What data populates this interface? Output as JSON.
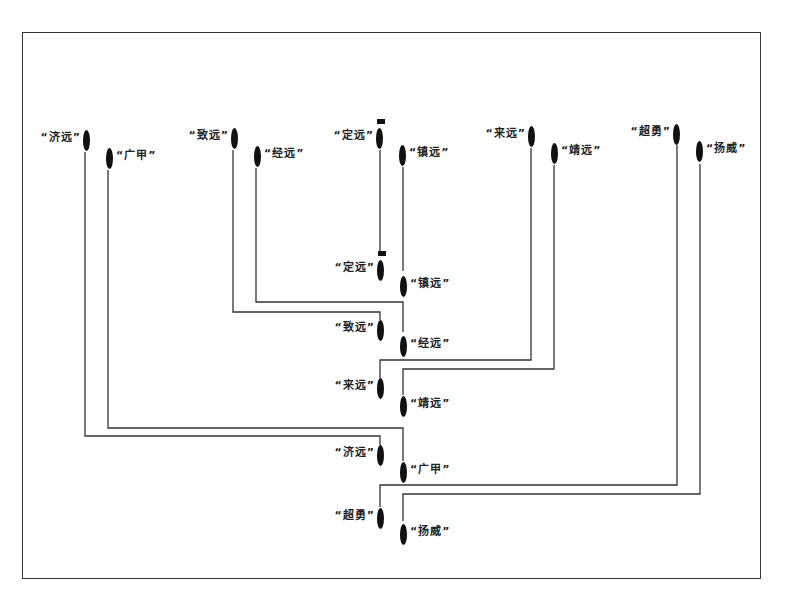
{
  "diagram": {
    "type": "naval-formation-change",
    "border": true,
    "line_color": "#333333",
    "ship_color": "#111111",
    "initial_formation": [
      {
        "id": "jiyuan_0",
        "label": "“济远”",
        "ship": {
          "x": 83,
          "y": 130
        },
        "label_side": "left"
      },
      {
        "id": "guangjia_0",
        "label": "“广甲”",
        "ship": {
          "x": 106,
          "y": 148
        },
        "label_side": "right"
      },
      {
        "id": "zhiyuan_0",
        "label": "“致远”",
        "ship": {
          "x": 231,
          "y": 128
        },
        "label_side": "left"
      },
      {
        "id": "jingyuan_0",
        "label": "“经远”",
        "ship": {
          "x": 254,
          "y": 146
        },
        "label_side": "right"
      },
      {
        "id": "dingyuan_0",
        "label": "“定远”",
        "ship": {
          "x": 376,
          "y": 128
        },
        "label_side": "left",
        "flag": true
      },
      {
        "id": "zhenyuan_0",
        "label": "“镇远”",
        "ship": {
          "x": 399,
          "y": 145
        },
        "label_side": "right"
      },
      {
        "id": "laiyuan_0",
        "label": "“来远”",
        "ship": {
          "x": 528,
          "y": 126
        },
        "label_side": "left"
      },
      {
        "id": "jingyuan2_0",
        "label": "“靖远”",
        "ship": {
          "x": 551,
          "y": 143
        },
        "label_side": "right"
      },
      {
        "id": "chaoyong_0",
        "label": "“超勇”",
        "ship": {
          "x": 673,
          "y": 124
        },
        "label_side": "left"
      },
      {
        "id": "yangwei_0",
        "label": "“扬威”",
        "ship": {
          "x": 696,
          "y": 141
        },
        "label_side": "right"
      }
    ],
    "final_formation": [
      {
        "id": "dingyuan_1",
        "label": "“定远”",
        "ship": {
          "x": 377,
          "y": 260
        },
        "label_side": "left",
        "flag": true
      },
      {
        "id": "zhenyuan_1",
        "label": "“镇远”",
        "ship": {
          "x": 400,
          "y": 276
        },
        "label_side": "right"
      },
      {
        "id": "zhiyuan_1",
        "label": "“致远”",
        "ship": {
          "x": 377,
          "y": 320
        },
        "label_side": "left"
      },
      {
        "id": "jingyuan_1",
        "label": "“经远”",
        "ship": {
          "x": 400,
          "y": 336
        },
        "label_side": "right"
      },
      {
        "id": "laiyuan_1",
        "label": "“来远”",
        "ship": {
          "x": 377,
          "y": 378
        },
        "label_side": "left"
      },
      {
        "id": "jingyuan2_1",
        "label": "“靖远”",
        "ship": {
          "x": 400,
          "y": 396
        },
        "label_side": "right"
      },
      {
        "id": "jiyuan_1",
        "label": "“济远”",
        "ship": {
          "x": 377,
          "y": 445
        },
        "label_side": "left"
      },
      {
        "id": "guangjia_1",
        "label": "“广甲”",
        "ship": {
          "x": 400,
          "y": 462
        },
        "label_side": "right"
      },
      {
        "id": "chaoyong_1",
        "label": "“超勇”",
        "ship": {
          "x": 377,
          "y": 508
        },
        "label_side": "left"
      },
      {
        "id": "yangwei_1",
        "label": "“扬威”",
        "ship": {
          "x": 400,
          "y": 524
        },
        "label_side": "right"
      }
    ],
    "paths": [
      {
        "from": "dingyuan_0",
        "to": "dingyuan_1",
        "points": "380,150 380,253"
      },
      {
        "from": "zhenyuan_0",
        "to": "zhenyuan_1",
        "points": "403,167 403,271"
      },
      {
        "from": "zhiyuan_0",
        "to": "zhiyuan_1",
        "points": "233,150 233,312 380,312 380,320"
      },
      {
        "from": "jingyuan_0",
        "to": "jingyuan_1",
        "points": "256,168 256,302 403,302 403,332"
      },
      {
        "from": "laiyuan_0",
        "to": "laiyuan_1",
        "points": "531,148 531,360 380,360 380,378"
      },
      {
        "from": "jingyuan2_0",
        "to": "jingyuan2_1",
        "points": "554,165 554,369 403,369 403,395"
      },
      {
        "from": "jiyuan_0",
        "to": "jiyuan_1",
        "points": "85,152 85,436 380,436 380,445"
      },
      {
        "from": "guangjia_0",
        "to": "guangjia_1",
        "points": "108,170 108,428 403,428 403,461"
      },
      {
        "from": "chaoyong_0",
        "to": "chaoyong_1",
        "points": "677,145 677,485 380,485 380,507"
      },
      {
        "from": "yangwei_0",
        "to": "yangwei_1",
        "points": "700,164 700,494 403,494 403,521"
      }
    ]
  }
}
